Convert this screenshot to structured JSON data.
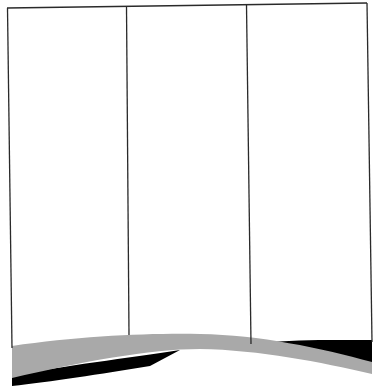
{
  "figure": {
    "subject": "three-panel folding display board with curved base",
    "panel_count": 3,
    "colors": {
      "background": "#ffffff",
      "outline": "#2a2a2a",
      "base_band": "#a9a9a9",
      "shadow": "#000000"
    }
  }
}
